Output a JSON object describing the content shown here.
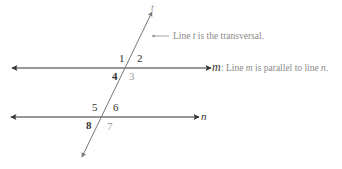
{
  "figure": {
    "type": "parallel-lines-cut-by-transversal",
    "lines": {
      "m": {
        "label": "m",
        "y": 68,
        "x1": 12,
        "x2": 211
      },
      "n": {
        "label": "n",
        "y": 117,
        "x1": 11,
        "x2": 199
      },
      "t": {
        "label": "t",
        "x1": 153,
        "y1": 10,
        "x2": 82,
        "y2": 158
      }
    },
    "annotations": {
      "transversal_note": "Line t is the transversal.",
      "parallel_note_prefix": ": Line ",
      "parallel_note": "Line m is parallel to line n."
    },
    "angles": {
      "a1": "1",
      "a2": "2",
      "a3": "3",
      "a4": "4",
      "a5": "5",
      "a6": "6",
      "a7": "7",
      "a8": "8"
    },
    "colors": {
      "line": "#333333",
      "transversal": "#777777",
      "note_text": "#8a8a8a",
      "light_number": "#9a9a9a"
    }
  }
}
